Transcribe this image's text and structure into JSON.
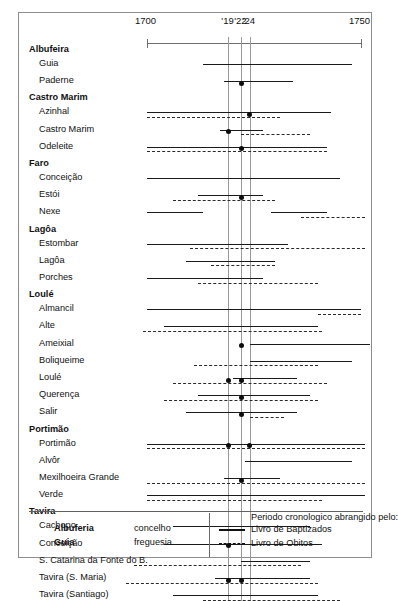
{
  "figure": {
    "axis": {
      "x_min": 1700,
      "x_max": 1750,
      "labels": [
        {
          "text": "1700",
          "value": 1700
        },
        {
          "text": "'19",
          "value": 1719
        },
        {
          "text": "'22",
          "value": 1722
        },
        {
          "text": "'24",
          "value": 1724
        },
        {
          "text": "1750",
          "value": 1750
        }
      ],
      "ticks": [
        1700,
        1719,
        1722,
        1724,
        1750
      ],
      "guide_lines": [
        1719,
        1722,
        1724
      ]
    },
    "legend": {
      "concelho_sample": "Albuferia",
      "concelho_word": "concelho",
      "freguesia_sample": "Guia",
      "freguesia_word": "freguesia",
      "title": "Periodo cronologico abrangido pelo:",
      "series": [
        {
          "label": "Livro de Baptizados",
          "style": "solid"
        },
        {
          "label": "Livro de Obitos",
          "style": "dashed"
        }
      ]
    }
  },
  "chart_data": {
    "type": "bar",
    "title": "",
    "xlabel": "",
    "ylabel": "",
    "xlim": [
      1700,
      1750
    ],
    "grid": false,
    "legend_position": "bottom",
    "series": [
      {
        "name": "Livro de Baptizados",
        "style": "solid"
      },
      {
        "name": "Livro de Obitos",
        "style": "dashed"
      }
    ],
    "groups": [
      {
        "concelho": "Albufeira",
        "freguesias": [
          {
            "label": "Guia",
            "baptizados": [
              [
                1713,
                1748
              ]
            ],
            "obitos": [],
            "markers": []
          },
          {
            "label": "Paderne",
            "baptizados": [
              [
                1718,
                1734
              ]
            ],
            "obitos": [],
            "markers": [
              1722
            ]
          }
        ]
      },
      {
        "concelho": "Castro Marim",
        "freguesias": [
          {
            "label": "Azinhal",
            "baptizados": [
              [
                1700,
                1743
              ]
            ],
            "obitos": [
              [
                1700,
                1731
              ]
            ],
            "markers": [
              1724
            ]
          },
          {
            "label": "Castro Marim",
            "baptizados": [
              [
                1717,
                1727
              ]
            ],
            "obitos": [
              [
                1722,
                1738
              ]
            ],
            "markers": [
              1719
            ]
          },
          {
            "label": "Odeleite",
            "baptizados": [
              [
                1700,
                1742
              ]
            ],
            "obitos": [
              [
                1700,
                1742
              ]
            ],
            "markers": [
              1722
            ]
          }
        ]
      },
      {
        "concelho": "Faro",
        "freguesias": [
          {
            "label": "Conceição",
            "baptizados": [
              [
                1700,
                1745
              ]
            ],
            "obitos": [],
            "markers": []
          },
          {
            "label": "Estói",
            "baptizados": [
              [
                1712,
                1727
              ]
            ],
            "obitos": [
              [
                1706,
                1730
              ]
            ],
            "markers": [
              1722
            ]
          },
          {
            "label": "Nexe",
            "baptizados": [
              [
                1700,
                1713
              ],
              [
                1729,
                1742
              ]
            ],
            "obitos": [
              [
                1736,
                1751
              ]
            ],
            "markers": []
          }
        ]
      },
      {
        "concelho": "Lagôa",
        "freguesias": [
          {
            "label": "Estombar",
            "baptizados": [
              [
                1700,
                1733
              ]
            ],
            "obitos": [
              [
                1710,
                1751
              ]
            ],
            "markers": []
          },
          {
            "label": "Lagôa",
            "baptizados": [
              [
                1709,
                1730
              ]
            ],
            "obitos": [
              [
                1715,
                1730
              ]
            ],
            "markers": []
          },
          {
            "label": "Porches",
            "baptizados": [
              [
                1700,
                1727
              ]
            ],
            "obitos": [
              [
                1712,
                1740
              ]
            ],
            "markers": []
          }
        ]
      },
      {
        "concelho": "Loulé",
        "freguesias": [
          {
            "label": "Almancil",
            "baptizados": [
              [
                1700,
                1750
              ]
            ],
            "obitos": [
              [
                1740,
                1750
              ]
            ],
            "markers": []
          },
          {
            "label": "Alte",
            "baptizados": [
              [
                1704,
                1740
              ]
            ],
            "obitos": [
              [
                1699,
                1741
              ]
            ],
            "markers": []
          },
          {
            "label": "Ameixial",
            "baptizados": [
              [
                1724,
                1752
              ]
            ],
            "obitos": [],
            "markers": [
              1722
            ]
          },
          {
            "label": "Boliqueime",
            "baptizados": [
              [
                1724,
                1748
              ]
            ],
            "obitos": [
              [
                1711,
                1740
              ]
            ],
            "markers": []
          },
          {
            "label": "Loulé",
            "baptizados": [
              [
                1720,
                1735
              ]
            ],
            "obitos": [
              [
                1706,
                1742
              ]
            ],
            "markers": [
              1719,
              1722
            ]
          },
          {
            "label": "Querença",
            "baptizados": [
              [
                1712,
                1738
              ]
            ],
            "obitos": [
              [
                1704,
                1740
              ]
            ],
            "markers": [
              1722
            ]
          },
          {
            "label": "Salir",
            "baptizados": [
              [
                1709,
                1735
              ]
            ],
            "obitos": [
              [
                1724,
                1732
              ]
            ],
            "markers": [
              1722
            ]
          }
        ]
      },
      {
        "concelho": "Portimão",
        "freguesias": [
          {
            "label": "Portimão",
            "baptizados": [
              [
                1700,
                1751
              ]
            ],
            "obitos": [
              [
                1700,
                1751
              ]
            ],
            "markers": [
              1719,
              1724
            ]
          },
          {
            "label": "Alvôr",
            "baptizados": [
              [
                1723,
                1748
              ]
            ],
            "obitos": [],
            "markers": []
          },
          {
            "label": "Mexilhoeira Grande",
            "baptizados": [
              [
                1718,
                1731
              ]
            ],
            "obitos": [
              [
                1700,
                1751
              ]
            ],
            "markers": [
              1722
            ]
          },
          {
            "label": "Verde",
            "baptizados": [
              [
                1700,
                1751
              ]
            ],
            "obitos": [
              [
                1700,
                1741
              ]
            ],
            "markers": []
          }
        ]
      },
      {
        "concelho": "Tavira",
        "freguesias": [
          {
            "label": "Cachopo",
            "baptizados": [
              [
                1706,
                1738
              ]
            ],
            "obitos": [],
            "markers": []
          },
          {
            "label": "Conceição",
            "baptizados": [
              [
                1704,
                1741
              ]
            ],
            "obitos": [],
            "markers": [
              1719
            ]
          },
          {
            "label": "S. Catarina da Fonte do B.",
            "baptizados": [
              [
                1722,
                1738
              ]
            ],
            "obitos": [
              [
                1697,
                1736
              ]
            ],
            "markers": []
          },
          {
            "label": "Tavira (S. Maria)",
            "baptizados": [
              [
                1716,
                1738
              ]
            ],
            "obitos": [
              [
                1695,
                1740
              ]
            ],
            "markers": [
              1719,
              1722
            ]
          },
          {
            "label": "Tavira (Santiago)",
            "baptizados": [
              [
                1706,
                1740
              ]
            ],
            "obitos": [
              [
                1713,
                1745
              ]
            ],
            "markers": []
          }
        ]
      }
    ]
  }
}
